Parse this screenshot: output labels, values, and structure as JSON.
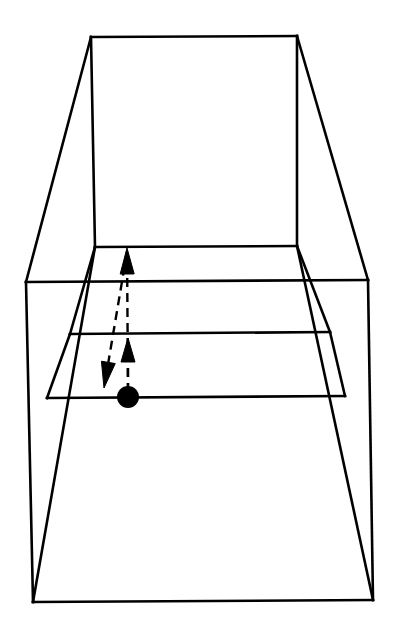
{
  "figure": {
    "title": "Perspective corridor line drawing with marker and motion arrows",
    "background_color": "#ffffff",
    "ink_color": "#000000",
    "canvas": {
      "width": 395,
      "height": 638
    }
  },
  "chart_data": {
    "type": "diagram",
    "title": "Perspective corridor line drawing with marker and motion arrows",
    "xlabel": "",
    "ylabel": "",
    "xlim": [
      0,
      395
    ],
    "ylim": [
      0,
      638
    ],
    "grid": false,
    "legend": "none",
    "strokes": {
      "outer_box_width": 2.6,
      "inner_line_width": 2.6,
      "dashed_width": 2.4,
      "dash_pattern": "9 6"
    },
    "shapes": [
      {
        "name": "far-wall-rectangle",
        "kind": "polygon",
        "closed": true,
        "style": "solid",
        "points": [
          [
            91,
            37
          ],
          [
            297,
            36
          ],
          [
            297,
            246
          ],
          [
            95,
            247
          ]
        ]
      },
      {
        "name": "outer-frame-left-wall",
        "kind": "polygon",
        "closed": true,
        "style": "solid",
        "points": [
          [
            91,
            37
          ],
          [
            26,
            282
          ],
          [
            26,
            602
          ],
          [
            95,
            247
          ]
        ]
      },
      {
        "name": "outer-frame-right-wall",
        "kind": "polygon",
        "closed": true,
        "style": "solid",
        "points": [
          [
            297,
            36
          ],
          [
            368,
            280
          ],
          [
            368,
            600
          ],
          [
            297,
            246
          ]
        ]
      },
      {
        "name": "near-opening-rectangle",
        "kind": "polygon",
        "closed": true,
        "style": "solid",
        "points": [
          [
            26,
            282
          ],
          [
            368,
            280
          ],
          [
            373,
            600
          ],
          [
            33,
            602
          ]
        ]
      },
      {
        "name": "floor-band-upper",
        "kind": "polyline",
        "closed": false,
        "style": "solid",
        "points": [
          [
            95,
            247
          ],
          [
            70,
            334
          ],
          [
            330,
            332
          ],
          [
            297,
            246
          ]
        ]
      },
      {
        "name": "floor-band-lower",
        "kind": "polyline",
        "closed": false,
        "style": "solid",
        "points": [
          [
            70,
            334
          ],
          [
            47,
            398
          ],
          [
            345,
            396
          ],
          [
            330,
            332
          ]
        ]
      }
    ],
    "segments": [
      {
        "name": "far-wall-top-edge",
        "from": [
          91,
          37
        ],
        "to": [
          297,
          36
        ]
      },
      {
        "name": "far-wall-left-edge",
        "from": [
          91,
          37
        ],
        "to": [
          95,
          247
        ]
      },
      {
        "name": "far-wall-right-edge",
        "from": [
          297,
          36
        ],
        "to": [
          297,
          246
        ]
      },
      {
        "name": "far-wall-bottom-edge",
        "from": [
          95,
          247
        ],
        "to": [
          297,
          246
        ]
      },
      {
        "name": "ceiling-left-receding-edge",
        "from": [
          91,
          37
        ],
        "to": [
          26,
          282
        ]
      },
      {
        "name": "ceiling-right-receding-edge",
        "from": [
          297,
          36
        ],
        "to": [
          368,
          280
        ]
      },
      {
        "name": "floor-left-receding-edge",
        "from": [
          95,
          247
        ],
        "to": [
          33,
          602
        ]
      },
      {
        "name": "floor-right-receding-edge",
        "from": [
          297,
          246
        ],
        "to": [
          373,
          600
        ]
      },
      {
        "name": "near-frame-top-edge",
        "from": [
          26,
          282
        ],
        "to": [
          368,
          280
        ]
      },
      {
        "name": "near-frame-left-edge",
        "from": [
          26,
          282
        ],
        "to": [
          33,
          602
        ]
      },
      {
        "name": "near-frame-right-edge",
        "from": [
          368,
          280
        ],
        "to": [
          373,
          600
        ]
      },
      {
        "name": "near-frame-bottom-edge",
        "from": [
          33,
          602
        ],
        "to": [
          373,
          600
        ]
      },
      {
        "name": "floor-stripe-1-line",
        "from": [
          70,
          334
        ],
        "to": [
          330,
          332
        ]
      },
      {
        "name": "floor-stripe-2-line",
        "from": [
          47,
          398
        ],
        "to": [
          345,
          396
        ]
      },
      {
        "name": "floor-stripe-left-connector-a",
        "from": [
          95,
          247
        ],
        "to": [
          70,
          334
        ]
      },
      {
        "name": "floor-stripe-left-connector-b",
        "from": [
          70,
          334
        ],
        "to": [
          47,
          398
        ]
      },
      {
        "name": "floor-stripe-right-connector-a",
        "from": [
          297,
          246
        ],
        "to": [
          330,
          332
        ]
      },
      {
        "name": "floor-stripe-right-connector-b",
        "from": [
          330,
          332
        ],
        "to": [
          345,
          396
        ]
      }
    ],
    "marker": {
      "name": "position-marker-dot",
      "kind": "filled-circle",
      "center": [
        128,
        397
      ],
      "radius": 11,
      "color": "#000000"
    },
    "arrows": [
      {
        "name": "long-forward-arrow",
        "direction": "up",
        "style": "dashed",
        "tail": [
          128,
          392
        ],
        "tip": [
          127,
          248
        ],
        "head_length": 26,
        "head_half_width": 7,
        "description": "Long dashed arrow from the marker dot toward the far wall base"
      },
      {
        "name": "short-forward-arrow",
        "direction": "up",
        "style": "dashed",
        "tail": [
          128,
          392
        ],
        "tip": [
          128,
          338
        ],
        "head_length": 24,
        "head_half_width": 7,
        "description": "Short dashed arrow from the marker dot to the first floor stripe"
      },
      {
        "name": "return-arrow",
        "direction": "down-left",
        "style": "dashed",
        "tail": [
          127,
          252
        ],
        "tip": [
          104,
          388
        ],
        "head_length": 26,
        "head_half_width": 7,
        "description": "Slanted dashed arrow returning from the far wall base down toward the near floor"
      }
    ]
  }
}
